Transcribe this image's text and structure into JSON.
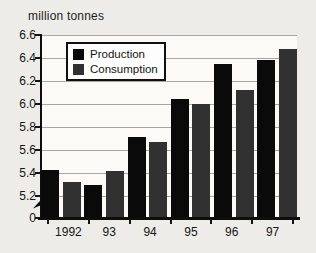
{
  "figure": {
    "unit_label": "million tonnes"
  },
  "chart_data": {
    "type": "bar",
    "title": "million tonnes",
    "xlabel": "",
    "ylabel": "million tonnes",
    "categories": [
      "1992",
      "93",
      "94",
      "95",
      "96",
      "97"
    ],
    "series": [
      {
        "name": "Production",
        "color": "#0a0a0a",
        "values": [
          5.43,
          5.3,
          5.71,
          6.04,
          6.35,
          6.38
        ]
      },
      {
        "name": "Consumption",
        "color": "#313131",
        "values": [
          5.32,
          5.42,
          5.67,
          6.0,
          6.12,
          6.48
        ]
      }
    ],
    "y_ticks": [
      6.6,
      6.4,
      6.2,
      6.0,
      5.8,
      5.6,
      5.4,
      5.2,
      0
    ],
    "y_axis_break_between": [
      0,
      5.2
    ],
    "ylim_display": [
      5.2,
      6.6
    ],
    "grid": true,
    "legend_position": "top-left",
    "colors": {
      "production": "#0a0a0a",
      "consumption": "#313131",
      "gridline": "#a8a7a2",
      "axis": "#0d0d0d",
      "background": "#eeece8"
    }
  }
}
